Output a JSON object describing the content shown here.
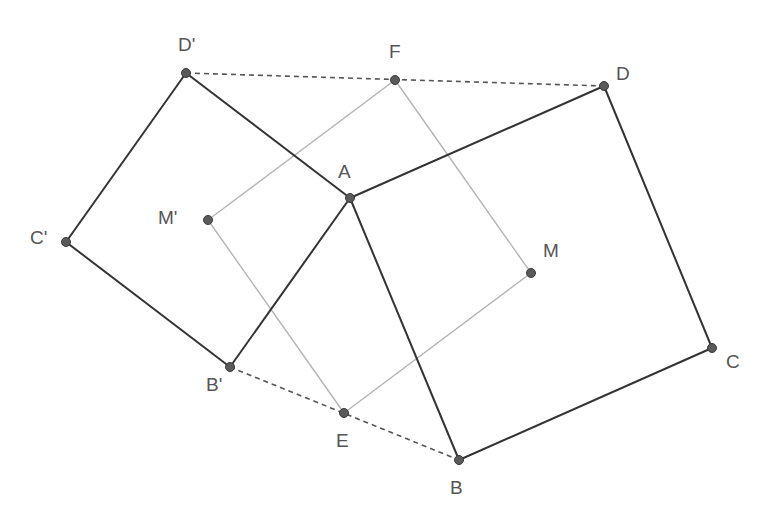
{
  "diagram": {
    "type": "geometry-construction",
    "points": [
      {
        "name": "A",
        "x": 350,
        "y": 198,
        "label_dx": -12,
        "label_dy": -36
      },
      {
        "name": "B",
        "x": 459,
        "y": 460,
        "label_dx": -9,
        "label_dy": 18
      },
      {
        "name": "C",
        "x": 712,
        "y": 348,
        "label_dx": 14,
        "label_dy": 4
      },
      {
        "name": "D",
        "x": 604,
        "y": 86,
        "label_dx": 12,
        "label_dy": -22
      },
      {
        "name": "B'",
        "x": 230,
        "y": 367,
        "label_dx": -24,
        "label_dy": 8
      },
      {
        "name": "C'",
        "x": 66,
        "y": 242,
        "label_dx": -36,
        "label_dy": -14
      },
      {
        "name": "D'",
        "x": 186,
        "y": 73,
        "label_dx": -8,
        "label_dy": -38
      },
      {
        "name": "M",
        "x": 531,
        "y": 273,
        "label_dx": 12,
        "label_dy": -32
      },
      {
        "name": "M'",
        "x": 208,
        "y": 220,
        "label_dx": -50,
        "label_dy": -12
      },
      {
        "name": "E",
        "x": 344,
        "y": 413,
        "label_dx": -8,
        "label_dy": 18
      },
      {
        "name": "F",
        "x": 395,
        "y": 80,
        "label_dx": -6,
        "label_dy": -38
      }
    ],
    "solid_segments": [
      [
        "A",
        "B"
      ],
      [
        "B",
        "C"
      ],
      [
        "C",
        "D"
      ],
      [
        "D",
        "A"
      ],
      [
        "A",
        "B'"
      ],
      [
        "B'",
        "C'"
      ],
      [
        "C'",
        "D'"
      ],
      [
        "D'",
        "A"
      ]
    ],
    "light_segments": [
      [
        "E",
        "M"
      ],
      [
        "M",
        "F"
      ],
      [
        "F",
        "M'"
      ],
      [
        "M'",
        "E"
      ]
    ],
    "dashed_segments": [
      [
        "D'",
        "D"
      ],
      [
        "B'",
        "B"
      ]
    ],
    "colors": {
      "solid": "#333333",
      "light": "#b4b4b4",
      "dashed": "#555555",
      "point": "#5a5a5a",
      "label": "#555555"
    }
  }
}
